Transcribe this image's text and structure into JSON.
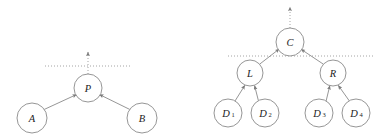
{
  "figure": {
    "title": "",
    "background_color": "#ffffff",
    "stroke_color": "#8a8a8a",
    "label_color": "#1c1c1c",
    "dotted_color": "#9a9a9a",
    "arrow_color": "#7a7a7a"
  },
  "diagram_left": {
    "name": "two-child-aggregation-tree",
    "nodes": [
      {
        "id": "P",
        "label": "P",
        "subscript": "",
        "cx": 88,
        "cy": 88,
        "r": 14
      },
      {
        "id": "A",
        "label": "A",
        "subscript": "",
        "cx": 32,
        "cy": 118,
        "r": 15
      },
      {
        "id": "B",
        "label": "B",
        "subscript": "",
        "cx": 142,
        "cy": 118,
        "r": 15
      }
    ],
    "edges": [
      {
        "from": "A",
        "to": "P"
      },
      {
        "from": "B",
        "to": "P"
      }
    ],
    "cut_line": {
      "y": 66,
      "x1": 45,
      "x2": 132
    },
    "outgoing_arrow": {
      "x": 88,
      "y_from": 74,
      "y_to": 51
    }
  },
  "diagram_right": {
    "name": "four-leaf-aggregation-tree",
    "nodes": [
      {
        "id": "C",
        "label": "C",
        "subscript": "",
        "cx": 290,
        "cy": 42,
        "r": 14
      },
      {
        "id": "L",
        "label": "L",
        "subscript": "",
        "cx": 250,
        "cy": 73,
        "r": 13
      },
      {
        "id": "R",
        "label": "R",
        "subscript": "",
        "cx": 333,
        "cy": 73,
        "r": 13
      },
      {
        "id": "D1",
        "label": "D",
        "subscript": "1",
        "cx": 228,
        "cy": 113,
        "r": 14
      },
      {
        "id": "D2",
        "label": "D",
        "subscript": "2",
        "cx": 265,
        "cy": 113,
        "r": 14
      },
      {
        "id": "D3",
        "label": "D",
        "subscript": "3",
        "cx": 319,
        "cy": 113,
        "r": 14
      },
      {
        "id": "D4",
        "label": "D",
        "subscript": "4",
        "cx": 356,
        "cy": 113,
        "r": 14
      }
    ],
    "edges": [
      {
        "from": "L",
        "to": "C"
      },
      {
        "from": "R",
        "to": "C"
      },
      {
        "from": "D1",
        "to": "L"
      },
      {
        "from": "D2",
        "to": "L"
      },
      {
        "from": "D3",
        "to": "R"
      },
      {
        "from": "D4",
        "to": "R"
      }
    ],
    "cut_line": {
      "y": 56,
      "x1": 228,
      "x2": 375
    },
    "outgoing_arrow": {
      "x": 290,
      "y_from": 28,
      "y_to": 6
    }
  }
}
